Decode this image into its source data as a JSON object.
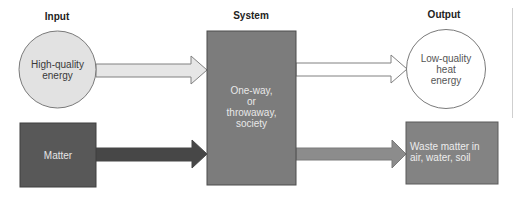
{
  "headers": {
    "input": "Input",
    "system": "System",
    "output": "Output"
  },
  "nodes": {
    "input_energy": {
      "label_lines": [
        "High-quality",
        "energy"
      ],
      "shape": "circle",
      "fill": "#e2e2e2",
      "stroke": "#7a7a7a",
      "text_color": "#3a3a3a"
    },
    "input_matter": {
      "label": "Matter",
      "shape": "rect",
      "fill": "#585858",
      "text_color": "#e6e6e6"
    },
    "system": {
      "label_lines": [
        "One-way,",
        "or",
        "throwaway,",
        "society"
      ],
      "shape": "rect",
      "fill": "#7c7c7c",
      "text_color": "#e8e8e8"
    },
    "output_energy": {
      "label_lines": [
        "Low-quality",
        "heat",
        "energy"
      ],
      "shape": "circle",
      "fill": "#ffffff",
      "stroke": "#7a7a7a",
      "text_color": "#555555"
    },
    "output_waste": {
      "label_lines": [
        "Waste matter in",
        "air, water, soil"
      ],
      "shape": "rect",
      "fill": "#838383",
      "text_color": "#ededed"
    }
  },
  "edges": [
    {
      "from": "input_energy",
      "to": "system",
      "fill": "#e6e6e6",
      "stroke": "#808080"
    },
    {
      "from": "input_matter",
      "to": "system",
      "fill": "#474747",
      "stroke": "#474747"
    },
    {
      "from": "system",
      "to": "output_energy",
      "fill": "#ffffff",
      "stroke": "#808080"
    },
    {
      "from": "system",
      "to": "output_waste",
      "fill": "#8c8c8c",
      "stroke": "#7a7a7a"
    }
  ]
}
